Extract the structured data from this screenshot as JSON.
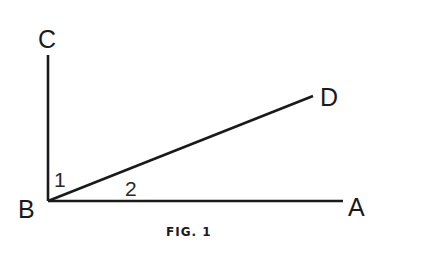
{
  "figure": {
    "caption": "FIG. 1",
    "points": {
      "A": {
        "label": "A",
        "x": 343,
        "y": 201
      },
      "B": {
        "label": "B",
        "x": 48,
        "y": 201
      },
      "C": {
        "label": "C",
        "x": 48,
        "y": 55
      },
      "D": {
        "label": "D",
        "x": 313,
        "y": 96
      }
    },
    "segments": [
      {
        "name": "BC",
        "from": "B",
        "to": "C"
      },
      {
        "name": "BA",
        "from": "B",
        "to": "A"
      },
      {
        "name": "BD",
        "from": "B",
        "to": "D"
      }
    ],
    "angles": [
      {
        "label": "1",
        "between": [
          "BC",
          "BD"
        ]
      },
      {
        "label": "2",
        "between": [
          "BD",
          "BA"
        ]
      }
    ]
  }
}
